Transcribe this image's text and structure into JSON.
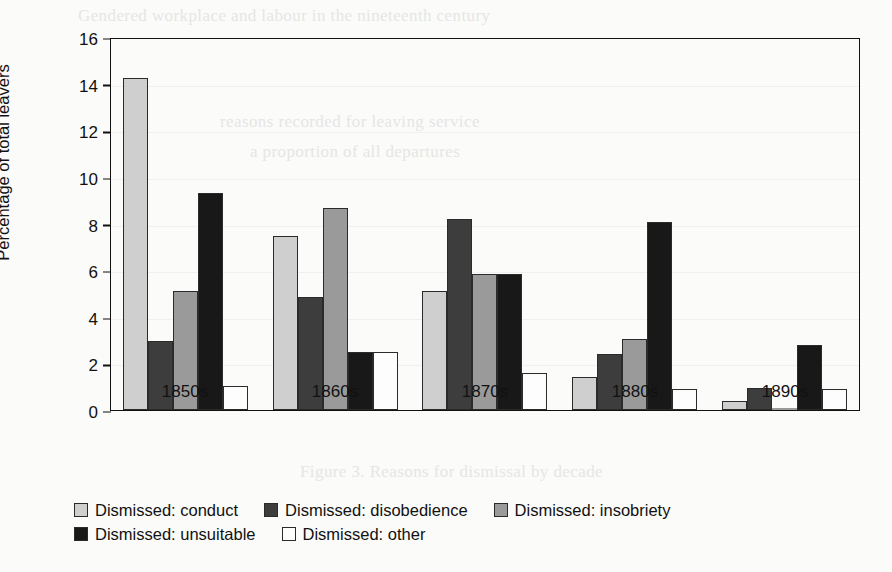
{
  "chart_data": {
    "type": "bar",
    "title": "",
    "xlabel": "",
    "ylabel": "Percentage of total leavers",
    "ylim": [
      0,
      16
    ],
    "ytick_step": 2,
    "yticks": [
      "16",
      "14",
      "12",
      "10",
      "8",
      "6",
      "4",
      "2",
      "0"
    ],
    "grid": true,
    "legend_position": "bottom-left",
    "categories": [
      "1850s",
      "1860s",
      "1870s",
      "1880s",
      "1890s"
    ],
    "series": [
      {
        "name": "Dismissed: conduct",
        "color": "#cfcfcf",
        "values": [
          14.25,
          7.45,
          5.1,
          1.4,
          0.4
        ]
      },
      {
        "name": "Dismissed: disobedience",
        "color": "#3d3d3d",
        "values": [
          2.95,
          4.85,
          8.2,
          2.4,
          0.95
        ]
      },
      {
        "name": "Dismissed: insobriety",
        "color": "#9a9a9a",
        "values": [
          5.1,
          8.65,
          5.85,
          3.05,
          0
        ]
      },
      {
        "name": "Dismissed: unsuitable",
        "color": "#181818",
        "values": [
          9.3,
          2.5,
          5.85,
          8.05,
          2.8
        ]
      },
      {
        "name": "Dismissed: other",
        "color": "#fdfdfd",
        "values": [
          1.05,
          2.5,
          1.6,
          0.9,
          0.9
        ]
      }
    ]
  },
  "scan_artifacts": {
    "top_ghost": "Gendered workplace and labour in the nineteenth century",
    "mid_ghost_1": "reasons recorded for leaving service",
    "mid_ghost_2": "a proportion of all departures",
    "bottom_ghost": "Figure 3. Reasons for dismissal by decade"
  }
}
